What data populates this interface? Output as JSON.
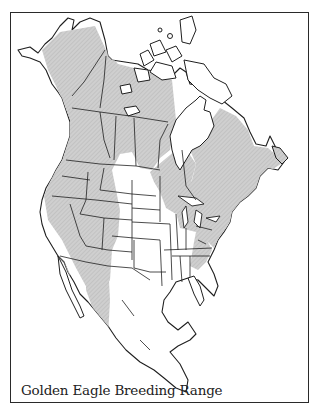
{
  "map": {
    "title": "Golden Eagle Breeding Range",
    "colors": {
      "range_fill": "#c9c9c9",
      "outline": "#1f1f1f",
      "background": "#ffffff",
      "frame": "#2a2a2a"
    },
    "legend": {
      "shaded": "breeding range"
    }
  }
}
